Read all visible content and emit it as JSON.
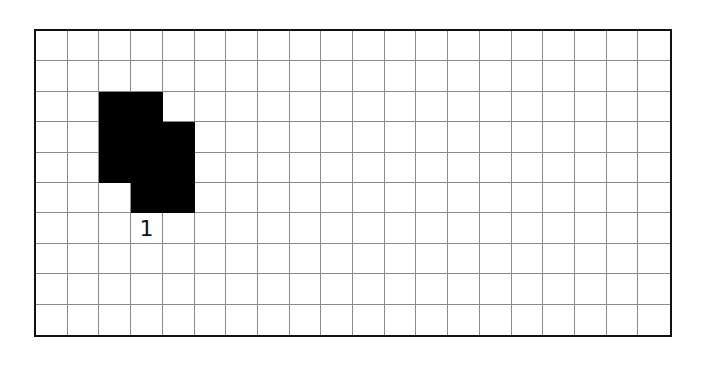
{
  "grid": {
    "columns": 20,
    "rows": 10,
    "line_color": "#8a8a8a",
    "border_color": "#111111",
    "fill_color": "#000000"
  },
  "shapes": [
    {
      "id": "shape-1",
      "label": "1",
      "cells": [
        [
          2,
          2
        ],
        [
          2,
          3
        ],
        [
          3,
          2
        ],
        [
          3,
          3
        ],
        [
          3,
          4
        ],
        [
          4,
          2
        ],
        [
          4,
          3
        ],
        [
          4,
          4
        ],
        [
          5,
          3
        ],
        [
          5,
          4
        ]
      ],
      "label_cell": [
        6,
        3
      ]
    }
  ]
}
